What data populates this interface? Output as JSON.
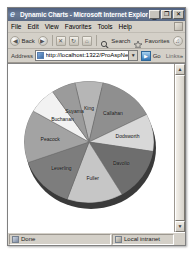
{
  "window": {
    "title": "Dynamic Charts - Microsoft Internet Explorer",
    "logo_icon": "ie-logo-icon",
    "minimize_label": "_",
    "maximize_label": "❐",
    "close_label": "✕"
  },
  "menu": {
    "items": [
      {
        "label": "File"
      },
      {
        "label": "Edit"
      },
      {
        "label": "View"
      },
      {
        "label": "Favorites"
      },
      {
        "label": "Tools"
      },
      {
        "label": "Help"
      }
    ]
  },
  "toolbar": {
    "back_label": "Back",
    "back_icon": "back-arrow-icon",
    "forward_icon": "forward-arrow-icon",
    "stop_icon": "stop-icon",
    "refresh_icon": "refresh-icon",
    "home_icon": "home-icon",
    "search_label": "Search",
    "search_icon": "search-icon",
    "favorites_label": "Favorites",
    "favorites_icon": "star-icon",
    "media_icon": "media-icon",
    "overflow_label": "»"
  },
  "address": {
    "label": "Address",
    "favicon": "page-favicon-icon",
    "url": "http://localhost:1322/ProAspNetAdv/",
    "dropdown_icon": "chevron-down-icon",
    "go_label": "Go",
    "go_icon": "go-arrow-icon",
    "links_label": "Links",
    "overflow_label": "»"
  },
  "scrollbar": {
    "up_icon": "▲",
    "down_icon": "▼"
  },
  "status": {
    "done_label": "Done",
    "done_icon": "page-done-icon",
    "zone_label": "Local intranet",
    "zone_icon": "local-intranet-icon",
    "grip_icon": "resize-grip-icon"
  },
  "chart_data": {
    "type": "pie",
    "title": "",
    "legend_position": "none",
    "labels_inside": true,
    "categories": [
      "King",
      "Callahan",
      "Dodsworth",
      "Davolio",
      "Fuller",
      "Leverling",
      "Peacock",
      "Buchanan",
      "Suyama"
    ],
    "values": [
      7,
      14,
      10,
      14,
      14,
      14,
      14,
      7,
      6
    ],
    "colors": [
      "#b6b6b6",
      "#8f8f8f",
      "#d8d8d8",
      "#6e6e6e",
      "#c6c6c6",
      "#7d7d7d",
      "#a3a3a3",
      "#f2f2f2",
      "#9b9b9b"
    ],
    "slices": [
      {
        "label": "King",
        "value": 7,
        "color": "#b6b6b6"
      },
      {
        "label": "Callahan",
        "value": 14,
        "color": "#8f8f8f"
      },
      {
        "label": "Dodsworth",
        "value": 10,
        "color": "#d8d8d8"
      },
      {
        "label": "Davolio",
        "value": 14,
        "color": "#6e6e6e"
      },
      {
        "label": "Fuller",
        "value": 14,
        "color": "#c6c6c6"
      },
      {
        "label": "Leverling",
        "value": 14,
        "color": "#7d7d7d"
      },
      {
        "label": "Peacock",
        "value": 14,
        "color": "#a3a3a3"
      },
      {
        "label": "Buchanan",
        "value": 7,
        "color": "#f2f2f2"
      },
      {
        "label": "Suyama",
        "value": 6,
        "color": "#9b9b9b"
      }
    ]
  }
}
